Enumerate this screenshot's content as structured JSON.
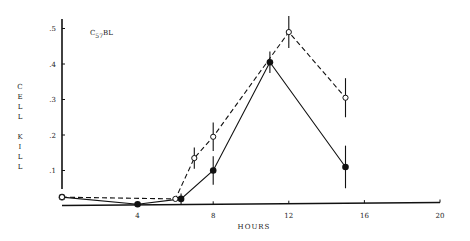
{
  "chart_data": {
    "type": "line",
    "title": "",
    "annotation": {
      "base": "C",
      "sub": "57",
      "suffix": "BL"
    },
    "xlabel": "HOURS",
    "ylabel": "CELL KILL",
    "xlim": [
      0,
      20
    ],
    "ylim": [
      0,
      0.53
    ],
    "x_ticks": [
      4,
      8,
      12,
      16,
      20
    ],
    "x_tick_labels": [
      "4",
      "8",
      "12",
      "16",
      "20"
    ],
    "y_ticks": [
      0.1,
      0.2,
      0.3,
      0.4,
      0.5
    ],
    "y_tick_labels": [
      ".1",
      ".2",
      ".3",
      ".4",
      ".5"
    ],
    "grid": false,
    "legend": null,
    "series": [
      {
        "name": "filled",
        "marker": "filled-circle",
        "line_style": "solid",
        "x": [
          0,
          4,
          6.3,
          8,
          11,
          15
        ],
        "values": [
          0.025,
          0.005,
          0.02,
          0.1,
          0.405,
          0.11
        ],
        "error": [
          0,
          0,
          0.015,
          0.04,
          0.03,
          0.06
        ]
      },
      {
        "name": "open",
        "marker": "open-circle",
        "line_style": "dashed",
        "x": [
          0,
          6,
          7,
          8,
          12,
          15
        ],
        "values": [
          0.025,
          0.02,
          0.135,
          0.195,
          0.49,
          0.305
        ],
        "error": [
          0,
          0,
          0.03,
          0.04,
          0.045,
          0.055
        ]
      }
    ]
  },
  "labels": {
    "xlabel": "HOURS",
    "ylabel_letters": [
      "C",
      "E",
      "L",
      "L",
      " ",
      "K",
      "I",
      "L",
      "L"
    ],
    "anno_base": "C",
    "anno_sub": "57",
    "anno_suffix": "BL"
  }
}
